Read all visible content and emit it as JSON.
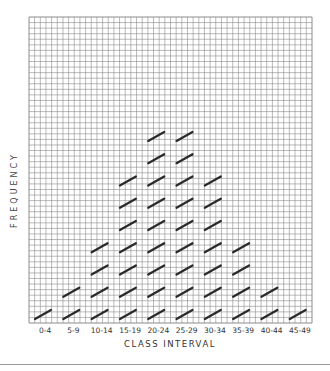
{
  "chart_data": {
    "type": "bar",
    "subtype": "tally-frequency",
    "title": "",
    "xlabel": "CLASS INTERVAL",
    "ylabel": "FREQUENCY",
    "categories": [
      "0-4",
      "5-9",
      "10-14",
      "15-19",
      "20-24",
      "25-29",
      "30-34",
      "35-39",
      "40-44",
      "45-49"
    ],
    "values": [
      1,
      2,
      4,
      7,
      9,
      9,
      7,
      4,
      2,
      1
    ],
    "ylim": [
      0,
      13
    ],
    "grid": true,
    "legend": null,
    "mark": "slash tally per unit"
  },
  "colors": {
    "grid": "#8c8c8c",
    "tally": "#2a2a2a",
    "text": "#333333",
    "separator": "#9a9a9a"
  }
}
